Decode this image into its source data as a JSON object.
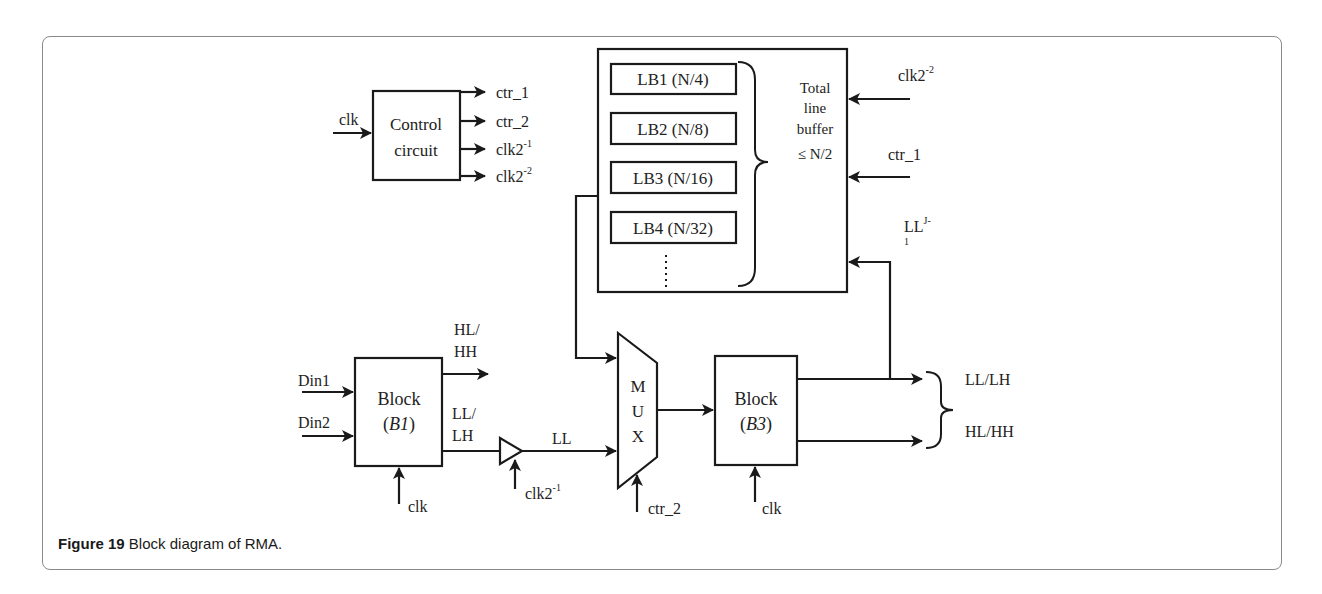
{
  "figure": {
    "caption_label": "Figure 19",
    "caption_text": " Block diagram of RMA."
  },
  "control_circuit": {
    "label_line1": "Control",
    "label_line2": "circuit",
    "input": "clk",
    "outputs": [
      {
        "base": "ctr_1",
        "sup": ""
      },
      {
        "base": "ctr_2",
        "sup": ""
      },
      {
        "base": "clk2",
        "sup": "-1"
      },
      {
        "base": "clk2",
        "sup": "-2"
      }
    ]
  },
  "line_buffer": {
    "buffers": [
      "LB1 (N/4)",
      "LB2 (N/8)",
      "LB3 (N/16)",
      "LB4 (N/32)"
    ],
    "ellipsis": "⋮",
    "total_label": [
      "Total",
      "line",
      "buffer",
      "≤ N/2"
    ],
    "inputs": [
      {
        "base": "clk2",
        "sup": "-2"
      },
      {
        "base": "ctr_1",
        "sup": ""
      },
      {
        "base": "LL",
        "sup": "J-",
        "sub": "1"
      }
    ]
  },
  "block_b1": {
    "label": "Block",
    "name_open": "(",
    "name": "B1",
    "name_close": ")",
    "inputs": [
      "Din1",
      "Din2"
    ],
    "clock": "clk",
    "output_high_line1": "HL/",
    "output_high_line2": "HH",
    "output_low_line1": "LL/",
    "output_low_line2": "LH"
  },
  "delay": {
    "output_label": "LL",
    "clock": {
      "base": "clk2",
      "sup": "-1"
    }
  },
  "mux": {
    "letters": [
      "M",
      "U",
      "X"
    ],
    "select": "ctr_2"
  },
  "block_b3": {
    "label": "Block",
    "name_open": "(",
    "name": "B3",
    "name_close": ")",
    "clock": "clk",
    "outputs": [
      "LL/LH",
      "HL/HH"
    ]
  },
  "colors": {
    "stroke": "#1a1a1a",
    "card_border": "#8a8a8a",
    "background": "#ffffff"
  }
}
